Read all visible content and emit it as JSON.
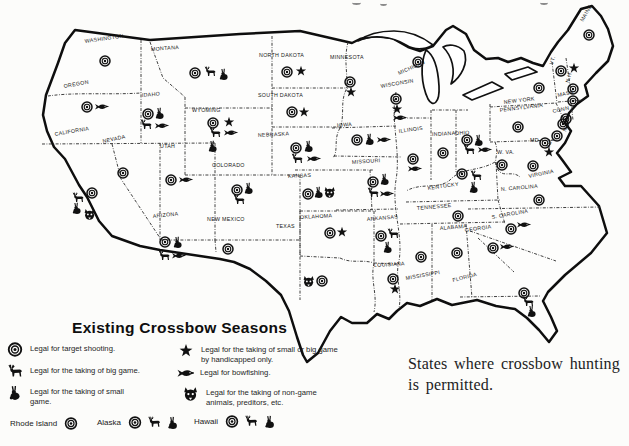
{
  "caption": {
    "line1": "States where crossbow hunting",
    "line2": "is permitted."
  },
  "legend": {
    "title": "Existing Crossbow Seasons",
    "items": [
      {
        "icon": "target",
        "text": "Legal for target shooting."
      },
      {
        "icon": "big-game",
        "text": "Legal for the taking of big game."
      },
      {
        "icon": "small-game",
        "text": "Legal for the taking of small game."
      },
      {
        "icon": "star",
        "text": "Legal for the taking of small or big game by handicapped only."
      },
      {
        "icon": "fish",
        "text": "Legal for bowfishing."
      },
      {
        "icon": "predator",
        "text": "Legal for the taking of non-game animals, preditors, etc."
      }
    ],
    "extras": [
      {
        "name": "Rhode Island",
        "symbols": [
          "target"
        ]
      },
      {
        "name": "Alaska",
        "symbols": [
          "target",
          "big-game",
          "small-game"
        ]
      },
      {
        "name": "Hawaii",
        "symbols": [
          "target",
          "big-game",
          "small-game"
        ]
      }
    ]
  },
  "map": {
    "states": [
      {
        "n": "WASHINGTON",
        "lx": 85,
        "ly": 43,
        "lr": -8,
        "s": [
          [
            "target",
            105,
            61
          ]
        ]
      },
      {
        "n": "OREGON",
        "lx": 64,
        "ly": 88,
        "lr": -10,
        "s": [
          [
            "target",
            87,
            107
          ],
          [
            "fish",
            101,
            107
          ]
        ]
      },
      {
        "n": "CALIFORNIA",
        "lx": 55,
        "ly": 136,
        "lr": -10,
        "s": [
          [
            "big-game",
            78,
            198
          ],
          [
            "target",
            92,
            193
          ],
          [
            "small-game",
            77,
            208
          ],
          [
            "predator",
            90,
            214
          ]
        ]
      },
      {
        "n": "NEVADA",
        "lx": 103,
        "ly": 143,
        "lr": -12,
        "s": [
          [
            "target",
            123,
            173
          ]
        ]
      },
      {
        "n": "IDAHO",
        "lx": 142,
        "ly": 97,
        "lr": -5,
        "s": [
          [
            "target",
            148,
            114
          ],
          [
            "small-game",
            160,
            113
          ],
          [
            "big-game",
            146,
            125
          ],
          [
            "fish",
            161,
            126
          ]
        ]
      },
      {
        "n": "MONTANA",
        "lx": 151,
        "ly": 51,
        "lr": -4,
        "s": [
          [
            "target",
            195,
            73
          ],
          [
            "big-game",
            210,
            72
          ],
          [
            "small-game",
            224,
            74
          ]
        ]
      },
      {
        "n": "WYOMING",
        "lx": 192,
        "ly": 112,
        "lr": 0,
        "s": [
          [
            "target",
            213,
            123
          ],
          [
            "star",
            229,
            122
          ],
          [
            "big-game",
            215,
            133
          ],
          [
            "fish",
            230,
            133
          ],
          [
            "small-game",
            213,
            146
          ]
        ]
      },
      {
        "n": "UTAH",
        "lx": 160,
        "ly": 148,
        "lr": 0,
        "s": [
          [
            "target",
            171,
            180
          ],
          [
            "fish",
            185,
            180
          ]
        ]
      },
      {
        "n": "ARIZONA",
        "lx": 153,
        "ly": 218,
        "lr": -6,
        "s": [
          [
            "target",
            165,
            242
          ],
          [
            "small-game",
            178,
            242
          ],
          [
            "big-game",
            164,
            256
          ],
          [
            "fish",
            178,
            256
          ]
        ]
      },
      {
        "n": "NEW MEXICO",
        "lx": 207,
        "ly": 221,
        "lr": 0,
        "s": [
          [
            "target",
            228,
            249
          ]
        ]
      },
      {
        "n": "COLORADO",
        "lx": 212,
        "ly": 167,
        "lr": 0,
        "s": [
          [
            "target",
            237,
            190
          ],
          [
            "small-game",
            249,
            188
          ],
          [
            "big-game",
            239,
            200
          ]
        ]
      },
      {
        "n": "NORTH DAKOTA",
        "lx": 259,
        "ly": 57,
        "lr": 0,
        "s": [
          [
            "target",
            287,
            72
          ],
          [
            "star",
            301,
            71
          ]
        ]
      },
      {
        "n": "SOUTH DAKOTA",
        "lx": 258,
        "ly": 97,
        "lr": 0,
        "s": [
          [
            "target",
            292,
            112
          ],
          [
            "star",
            304,
            112
          ]
        ]
      },
      {
        "n": "NEBRASKA",
        "lx": 258,
        "ly": 137,
        "lr": -3,
        "s": [
          [
            "target",
            296,
            148
          ],
          [
            "small-game",
            309,
            146
          ],
          [
            "big-game",
            297,
            159
          ],
          [
            "fish",
            313,
            159
          ]
        ]
      },
      {
        "n": "KANSAS",
        "lx": 288,
        "ly": 178,
        "lr": -3,
        "s": [
          [
            "target",
            308,
            194
          ],
          [
            "small-game",
            319,
            192
          ],
          [
            "predator",
            330,
            192
          ]
        ]
      },
      {
        "n": "OKLAHOMA",
        "lx": 300,
        "ly": 219,
        "lr": -3,
        "s": [
          [
            "target",
            330,
            233
          ],
          [
            "star",
            342,
            232
          ]
        ]
      },
      {
        "n": "TEXAS",
        "lx": 276,
        "ly": 228,
        "lr": 0,
        "s": [
          [
            "predator",
            309,
            281
          ],
          [
            "target",
            322,
            281
          ]
        ]
      },
      {
        "n": "MINNESOTA",
        "lx": 330,
        "ly": 59,
        "lr": 0,
        "s": [
          [
            "target",
            350,
            82
          ],
          [
            "star",
            351,
            92
          ]
        ]
      },
      {
        "n": "IOWA",
        "lx": 337,
        "ly": 127,
        "lr": -4,
        "s": [
          [
            "target",
            357,
            140
          ],
          [
            "small-game",
            370,
            139
          ],
          [
            "fish",
            383,
            140
          ]
        ]
      },
      {
        "n": "MISSOURI",
        "lx": 352,
        "ly": 164,
        "lr": -4,
        "s": [
          [
            "target",
            373,
            182
          ],
          [
            "small-game",
            385,
            179
          ],
          [
            "big-game",
            373,
            193
          ],
          [
            "fish",
            386,
            194
          ]
        ]
      },
      {
        "n": "ARKANSAS",
        "lx": 367,
        "ly": 221,
        "lr": -5,
        "s": [
          [
            "target",
            381,
            236
          ],
          [
            "big-game",
            393,
            234
          ],
          [
            "small-game",
            388,
            247
          ]
        ]
      },
      {
        "n": "LOUISIANA",
        "lx": 374,
        "ly": 267,
        "lr": -3,
        "s": [
          [
            "target",
            393,
            279
          ],
          [
            "star",
            395,
            289
          ]
        ]
      },
      {
        "n": "MISSISSIPPI",
        "lx": 406,
        "ly": 280,
        "lr": -10,
        "s": [
          [
            "target",
            421,
            257
          ]
        ]
      },
      {
        "n": "WISCONSIN",
        "lx": 381,
        "ly": 88,
        "lr": -10,
        "s": [
          [
            "target",
            396,
            99
          ],
          [
            "star",
            397,
            109
          ],
          [
            "fish",
            399,
            118
          ]
        ]
      },
      {
        "n": "MICHIGAN",
        "lx": 399,
        "ly": 75,
        "lr": -24,
        "s": [
          [
            "target",
            418,
            62
          ]
        ]
      },
      {
        "n": "ILLINOIS",
        "lx": 399,
        "ly": 133,
        "lr": -8,
        "s": [
          [
            "target",
            413,
            159
          ],
          [
            "fish",
            414,
            169
          ]
        ]
      },
      {
        "n": "INDIANA",
        "lx": 432,
        "ly": 136,
        "lr": -3,
        "s": [
          [
            "target",
            443,
            153
          ]
        ]
      },
      {
        "n": "OHIO",
        "lx": 455,
        "ly": 135,
        "lr": -3,
        "s": [
          [
            "target",
            467,
            140
          ],
          [
            "small-game",
            479,
            140
          ],
          [
            "big-game",
            469,
            150
          ],
          [
            "fish",
            484,
            150
          ]
        ]
      },
      {
        "n": "KENTUCKY",
        "lx": 428,
        "ly": 190,
        "lr": -8,
        "s": [
          [
            "target",
            462,
            174
          ],
          [
            "big-game",
            476,
            176
          ],
          [
            "small-game",
            474,
            187
          ]
        ]
      },
      {
        "n": "TENNESSEE",
        "lx": 417,
        "ly": 210,
        "lr": -5,
        "s": [
          [
            "target",
            458,
            216
          ]
        ]
      },
      {
        "n": "ALABAMA",
        "lx": 440,
        "ly": 230,
        "lr": -5,
        "s": [
          [
            "target",
            457,
            253
          ]
        ]
      },
      {
        "n": "GEORGIA",
        "lx": 465,
        "ly": 232,
        "lr": -8,
        "s": [
          [
            "target",
            493,
            248
          ],
          [
            "fish",
            506,
            247
          ]
        ]
      },
      {
        "n": "FLORIDA",
        "lx": 453,
        "ly": 282,
        "lr": -14,
        "s": [
          [
            "target",
            524,
            293
          ],
          [
            "big-game",
            528,
            302
          ],
          [
            "small-game",
            532,
            311
          ]
        ]
      },
      {
        "n": "S. CAROLINA",
        "lx": 492,
        "ly": 219,
        "lr": -10,
        "s": [
          [
            "target",
            511,
            229
          ],
          [
            "fish",
            523,
            225
          ]
        ]
      },
      {
        "n": "N. CAROLINA",
        "lx": 501,
        "ly": 191,
        "lr": -5,
        "s": [
          [
            "target",
            539,
            200
          ]
        ]
      },
      {
        "n": "VIRGINIA",
        "lx": 529,
        "ly": 178,
        "lr": -12,
        "s": [
          [
            "target",
            533,
            166
          ]
        ]
      },
      {
        "n": "W. VA.",
        "lx": 497,
        "ly": 154,
        "lr": 0,
        "fs": 4.4,
        "s": [
          [
            "target",
            502,
            165
          ]
        ]
      },
      {
        "n": "MD.",
        "lx": 530,
        "ly": 142,
        "lr": 0,
        "fs": 4.4,
        "s": [
          [
            "target",
            545,
            143
          ],
          [
            "star",
            549,
            152
          ]
        ]
      },
      {
        "n": "DEL.",
        "lx": 549,
        "ly": 149,
        "lr": -70,
        "fs": 4.2,
        "s": [
          [
            "target",
            557,
            136
          ]
        ]
      },
      {
        "n": "PENNSYLVANIA",
        "lx": 500,
        "ly": 112,
        "lr": -7,
        "s": [
          [
            "target",
            518,
            127
          ]
        ]
      },
      {
        "n": "NEW YORK",
        "lx": 504,
        "ly": 104,
        "lr": -7,
        "s": [
          [
            "target",
            539,
            88
          ]
        ]
      },
      {
        "n": "N.J.",
        "lx": 566,
        "ly": 132,
        "lr": -70,
        "fs": 4.2,
        "s": [
          [
            "target",
            563,
            124
          ]
        ]
      },
      {
        "n": "CONN.",
        "lx": 553,
        "ly": 113,
        "lr": -12,
        "fs": 4.2,
        "s": [
          [
            "target",
            566,
            119
          ]
        ]
      },
      {
        "n": "MASS.",
        "lx": 558,
        "ly": 97,
        "lr": -12,
        "fs": 4.2,
        "s": [
          [
            "target",
            573,
            101
          ]
        ]
      },
      {
        "n": "VT.",
        "lx": 553,
        "ly": 65,
        "lr": -75,
        "fs": 4.2,
        "s": [
          [
            "target",
            561,
            71
          ]
        ]
      },
      {
        "n": "N.H.",
        "lx": 569,
        "ly": 83,
        "lr": -75,
        "fs": 4.2,
        "s": [
          [
            "target",
            573,
            89
          ],
          [
            "star",
            574,
            68
          ]
        ]
      },
      {
        "n": "MAINE",
        "lx": 583,
        "ly": 22,
        "lr": -60,
        "fs": 4.4,
        "s": [
          [
            "target",
            589,
            35
          ]
        ]
      }
    ]
  }
}
